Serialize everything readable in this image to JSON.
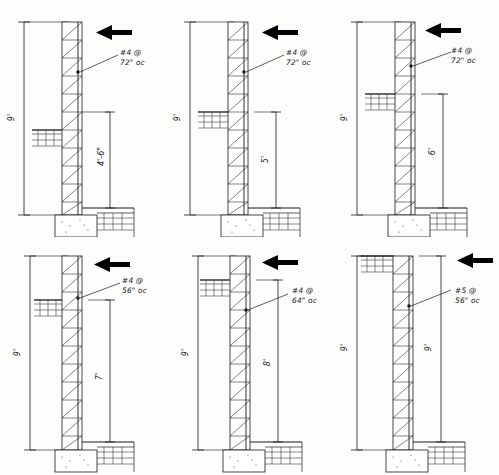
{
  "sheet": {
    "title": "Masonry Retaining Wall Sections",
    "panel_count": 6,
    "colors": {
      "ink": "#1a1a1a",
      "paper": "#fdfdfb",
      "hatch": "#2b2b2b",
      "arrow": "#000000"
    }
  },
  "icons": {
    "load_arrow": "arrow-left-icon",
    "rebar_dot": "rebar-point-icon",
    "dim_tick": "dimension-tick-icon"
  },
  "panels": [
    {
      "id": "panel-1",
      "rebar_note_line1": "#4 @",
      "rebar_note_line2": "72\" oc",
      "bar_size": "#4",
      "spacing": "72\" oc",
      "overall_height": "9'",
      "backfill_height": "4'-6\"",
      "arrow_label": "lateral-load-arrow",
      "grade_side": "left",
      "grade_y_frac": 0.56
    },
    {
      "id": "panel-2",
      "rebar_note_line1": "#4 @",
      "rebar_note_line2": "72\" oc",
      "bar_size": "#4",
      "spacing": "72\" oc",
      "overall_height": "9'",
      "backfill_height": "5'",
      "arrow_label": "lateral-load-arrow",
      "grade_side": "left",
      "grade_y_frac": 0.47
    },
    {
      "id": "panel-3",
      "rebar_note_line1": "#4 @",
      "rebar_note_line2": "72\" oc",
      "bar_size": "#4",
      "spacing": "72\" oc",
      "overall_height": "9'",
      "backfill_height": "6'",
      "arrow_label": "lateral-load-arrow",
      "grade_side": "left",
      "grade_y_frac": 0.38
    },
    {
      "id": "panel-4",
      "rebar_note_line1": "#4 @",
      "rebar_note_line2": "56\" oc",
      "bar_size": "#4",
      "spacing": "56\" oc",
      "overall_height": "9'",
      "backfill_height": "7'",
      "arrow_label": "lateral-load-arrow",
      "grade_side": "left",
      "grade_y_frac": 0.29
    },
    {
      "id": "panel-5",
      "rebar_note_line1": "#4 @",
      "rebar_note_line2": "64\" oc",
      "bar_size": "#4",
      "spacing": "64\" oc",
      "overall_height": "9'",
      "backfill_height": "8'",
      "arrow_label": "lateral-load-arrow",
      "grade_side": "left",
      "grade_y_frac": 0.2
    },
    {
      "id": "panel-6",
      "rebar_note_line1": "#5 @",
      "rebar_note_line2": "56\" oc",
      "bar_size": "#5",
      "spacing": "56\" oc",
      "overall_height": "9'",
      "backfill_height": "9'",
      "arrow_label": "lateral-load-arrow",
      "grade_side": "left",
      "grade_y_frac": 0.09
    }
  ]
}
